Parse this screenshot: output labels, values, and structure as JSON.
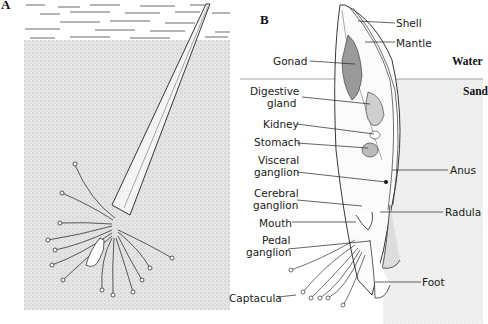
{
  "figure": {
    "panels": [
      {
        "id": "A",
        "label": "A",
        "description": "Scaphopod (tusk shell) burrowed in sand, captacula extended"
      },
      {
        "id": "B",
        "label": "B",
        "description": "Internal anatomy cross-section of scaphopod"
      }
    ],
    "panel_b": {
      "zones": {
        "water": "Water",
        "sand": "Sand"
      },
      "labels_left": [
        {
          "id": "gonad",
          "text": "Gonad"
        },
        {
          "id": "digestive-gland-1",
          "text": "Digestive"
        },
        {
          "id": "digestive-gland-2",
          "text": "gland"
        },
        {
          "id": "kidney",
          "text": "Kidney"
        },
        {
          "id": "stomach",
          "text": "Stomach"
        },
        {
          "id": "visceral-ganglion-1",
          "text": "Visceral"
        },
        {
          "id": "visceral-ganglion-2",
          "text": "ganglion"
        },
        {
          "id": "cerebral-ganglion-1",
          "text": "Cerebral"
        },
        {
          "id": "cerebral-ganglion-2",
          "text": "ganglion"
        },
        {
          "id": "mouth",
          "text": "Mouth"
        },
        {
          "id": "pedal-ganglion-1",
          "text": "Pedal"
        },
        {
          "id": "pedal-ganglion-2",
          "text": "ganglion"
        },
        {
          "id": "captacula",
          "text": "Captacula"
        }
      ],
      "labels_right": [
        {
          "id": "shell",
          "text": "Shell"
        },
        {
          "id": "mantle",
          "text": "Mantle"
        },
        {
          "id": "anus",
          "text": "Anus"
        },
        {
          "id": "radula",
          "text": "Radula"
        },
        {
          "id": "foot",
          "text": "Foot"
        }
      ]
    },
    "colors": {
      "ink": "#1a1a1a",
      "sand": "#e4e4e4",
      "background": "#ffffff",
      "gonad": "#9a9a9a"
    }
  }
}
